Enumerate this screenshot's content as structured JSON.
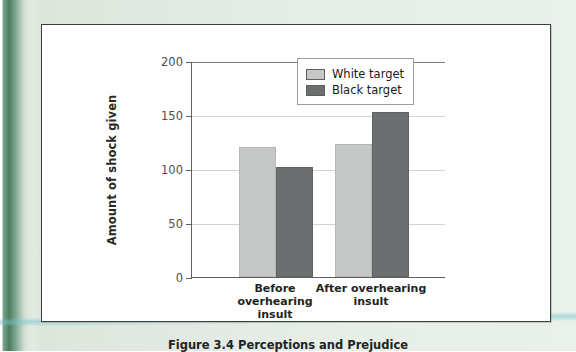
{
  "figure": {
    "caption": "Figure 3.4  Perceptions and Prejudice"
  },
  "chart_data": {
    "type": "bar",
    "title": "",
    "xlabel": "",
    "ylabel": "Amount of shock given",
    "categories": [
      "Before overhearing insult",
      "After overhearing insult"
    ],
    "category_lines": [
      [
        "Before overhearing",
        "insult"
      ],
      [
        "After overhearing",
        "insult"
      ]
    ],
    "series": [
      {
        "name": "White target",
        "values": [
          120,
          123
        ],
        "color": "#c6c8c7"
      },
      {
        "name": "Black target",
        "values": [
          102,
          153
        ],
        "color": "#6b6f70"
      }
    ],
    "ylim": [
      0,
      200
    ],
    "yticks": [
      0,
      50,
      100,
      150,
      200
    ],
    "ytick_labels": [
      "0",
      "50",
      "100",
      "150",
      "200"
    ],
    "grid": true,
    "legend_position": "top-right"
  }
}
